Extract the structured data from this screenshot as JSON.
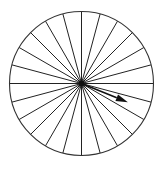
{
  "diagram": {
    "type": "spoked-circle-with-arrow",
    "circle": {
      "cx": 81.5,
      "cy": 83.5,
      "r": 72,
      "stroke": "#333333",
      "stroke_width": 1.1
    },
    "spokes": {
      "count": 24,
      "angle_step_deg": 15,
      "stroke": "#222222",
      "stroke_width": 1
    },
    "arrow": {
      "angle_deg": -22,
      "length": 50,
      "stroke": "#111111",
      "stroke_width": 1.6,
      "head_length": 12,
      "head_width": 7,
      "color": "#111111"
    },
    "hub": {
      "radius": 3,
      "color": "#111111"
    }
  }
}
